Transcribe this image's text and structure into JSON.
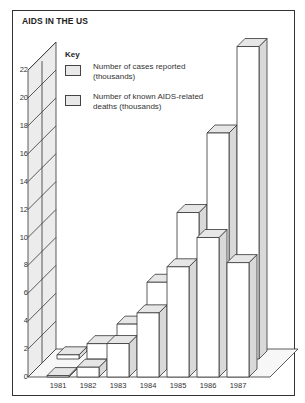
{
  "chart_data": {
    "type": "bar",
    "title": "AIDS IN THE US",
    "style": "3d-grouped-depth",
    "categories": [
      "1981",
      "1982",
      "1983",
      "1984",
      "1985",
      "1986",
      "1987"
    ],
    "series": [
      {
        "name": "Number of cases reported (thousands)",
        "values": [
          0.3,
          1.1,
          2.5,
          5.5,
          10.5,
          16.2,
          22.4
        ],
        "position": "back"
      },
      {
        "name": "Number of known AIDS-related deaths (thousands)",
        "values": [
          0.1,
          0.7,
          2.4,
          4.6,
          7.9,
          10.0,
          8.2
        ],
        "position": "front"
      }
    ],
    "xlabel": "",
    "ylabel": "",
    "ylim": [
      0,
      22
    ],
    "yticks": [
      "0",
      "2",
      "4",
      "6",
      "8",
      "10",
      "12",
      "14",
      "16",
      "18",
      "20",
      "22"
    ],
    "grid": true,
    "legend": {
      "title": "Key",
      "position": "top-left"
    }
  },
  "key": {
    "title": "Key",
    "items": [
      {
        "label": "Number of cases reported (thousands)"
      },
      {
        "label": "Number of known AIDS-related deaths (thousands)"
      }
    ]
  },
  "colors": {
    "face": "#ffffff",
    "top": "#e6e6e6",
    "side": "#d9d9d9",
    "wall": "#ececec",
    "line": "#333333"
  }
}
